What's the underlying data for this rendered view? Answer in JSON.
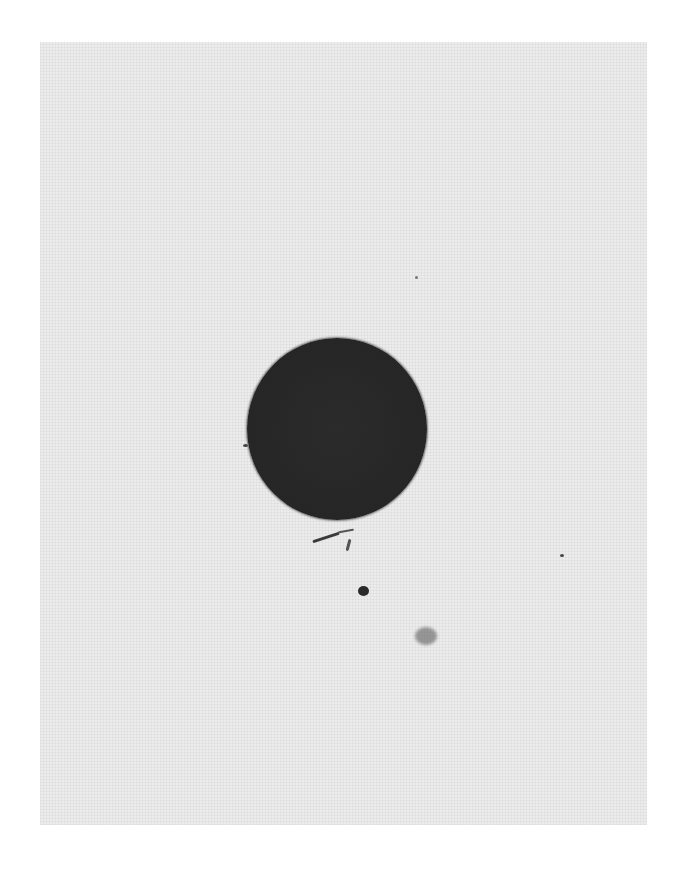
{
  "image": {
    "description": "Scanned halftone photograph of a dark circular spot on a light gray background",
    "background_color": "#ececec",
    "spot_color": "#282828",
    "features": [
      {
        "name": "main-dark-circle",
        "shape": "circle"
      },
      {
        "name": "streak-below-circle",
        "shape": "irregular"
      },
      {
        "name": "small-dark-dot",
        "shape": "dot"
      },
      {
        "name": "faint-smudge",
        "shape": "irregular"
      }
    ]
  }
}
